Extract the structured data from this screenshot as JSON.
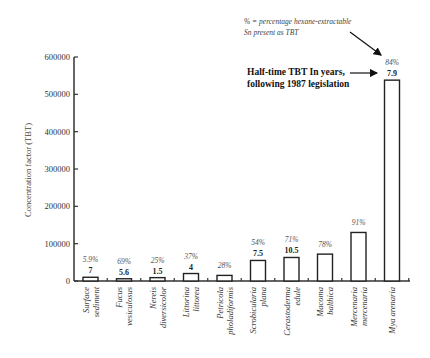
{
  "chart_data": {
    "type": "bar",
    "title": "",
    "xlabel": "",
    "ylabel": "Concentration factor (TBT)",
    "ylim": [
      0,
      600000
    ],
    "yticks": [
      0,
      100000,
      200000,
      300000,
      400000,
      500000,
      600000
    ],
    "grid": false,
    "categories": [
      "Surface sediment",
      "Fucus vesiculosus",
      "Nereis diversicolor",
      "Littorina littorea",
      "Petricola pholadiformis",
      "Scrobicularia plana",
      "Cerastoderma edule",
      "Macoma balthica",
      "Mercenaria mercenaria",
      "Mya arenaria"
    ],
    "category_lines": [
      [
        "Surface",
        "sediment"
      ],
      [
        "Fucus",
        "vesiculosus"
      ],
      [
        "Nereis",
        "diversicolor"
      ],
      [
        "Littorina",
        "littorea"
      ],
      [
        "Petricola",
        "pholadiformis"
      ],
      [
        "Scrobicularia",
        "plana"
      ],
      [
        "Cerastoderma",
        "edule"
      ],
      [
        "Macoma",
        "balthica"
      ],
      [
        "Mercenaria",
        "mercenaria"
      ],
      [
        "Mya arenaria"
      ]
    ],
    "values": [
      10000,
      6000,
      9000,
      20000,
      15000,
      55000,
      63000,
      72000,
      130000,
      538000
    ],
    "series": [
      {
        "name": "Concentration factor (TBT)",
        "values": [
          10000,
          6000,
          9000,
          20000,
          15000,
          55000,
          63000,
          72000,
          130000,
          538000
        ]
      }
    ],
    "percent_hexane_extractable": [
      "5.9%",
      "69%",
      "25%",
      "37%",
      "28%",
      "54%",
      "71%",
      "78%",
      "91%",
      "84%"
    ],
    "half_time_years": [
      "7",
      "5.6",
      "1.5",
      "4",
      "",
      "7.5",
      "10.5",
      "",
      "",
      "7.9"
    ],
    "annotations": [
      {
        "text_lines": [
          "% = percentage hexane-extractable",
          "Sn present as TBT"
        ],
        "points_to": "84%"
      },
      {
        "text_lines": [
          "Half-time TBT In years,",
          "following 1987 legislation"
        ],
        "points_to": "7.9"
      }
    ]
  },
  "axis": {
    "y_label": "Concentration factor (TBT)",
    "y_ticks": [
      "0",
      "100000",
      "200000",
      "300000",
      "400000",
      "500000",
      "600000"
    ]
  },
  "annotations": {
    "pct_note_line1": "% = percentage hexane-extractable",
    "pct_note_line2": "Sn present as TBT",
    "half_line1": "Half-time TBT In years,",
    "half_line2": "following 1987 legislation"
  }
}
